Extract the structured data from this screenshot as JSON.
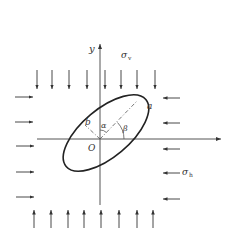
{
  "diagram": {
    "type": "stress-ellipse",
    "axes": {
      "x_label": "",
      "y_label": "y",
      "origin_label": "O"
    },
    "ellipse": {
      "semi_major_label": "a",
      "semi_minor_label": "b",
      "rotation_deg": 40
    },
    "angles": {
      "alpha": "α",
      "beta": "β"
    },
    "stresses": {
      "vertical": {
        "symbol": "σ",
        "subscript": "v",
        "arrow_count_top": 8,
        "arrow_count_bottom": 8
      },
      "horizontal": {
        "symbol": "σ",
        "subscript": "h",
        "arrow_count_left": 5,
        "arrow_count_right": 5
      }
    },
    "colors": {
      "line": "#333333",
      "background": "#ffffff"
    }
  }
}
